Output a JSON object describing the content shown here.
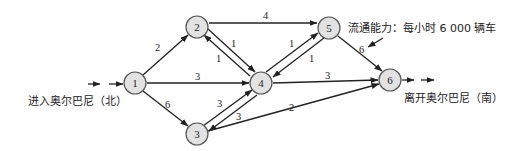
{
  "diagram": {
    "type": "directed-network-flow",
    "entry_label": "进入奥尔巴尼（北）",
    "exit_label": "离开奥尔巴尼（南）",
    "capacity_note": "流通能力：每小时 6 000 辆车",
    "nodes": [
      {
        "id": "1",
        "label": "1",
        "x": 135,
        "y": 83
      },
      {
        "id": "2",
        "label": "2",
        "x": 197,
        "y": 27
      },
      {
        "id": "3",
        "label": "3",
        "x": 197,
        "y": 134
      },
      {
        "id": "4",
        "label": "4",
        "x": 261,
        "y": 83
      },
      {
        "id": "5",
        "label": "5",
        "x": 329,
        "y": 28
      },
      {
        "id": "6",
        "label": "6",
        "x": 390,
        "y": 80
      }
    ],
    "edges": [
      {
        "from": "1",
        "to": "2",
        "capacity": "2"
      },
      {
        "from": "1",
        "to": "4",
        "capacity": "3"
      },
      {
        "from": "1",
        "to": "3",
        "capacity": "6"
      },
      {
        "from": "2",
        "to": "5",
        "capacity": "4"
      },
      {
        "from": "2",
        "to": "4",
        "capacity": "1"
      },
      {
        "from": "4",
        "to": "2",
        "capacity": "1"
      },
      {
        "from": "3",
        "to": "4",
        "capacity": "3"
      },
      {
        "from": "4",
        "to": "3",
        "capacity": "3"
      },
      {
        "from": "4",
        "to": "5",
        "capacity": "1"
      },
      {
        "from": "5",
        "to": "4",
        "capacity": "1"
      },
      {
        "from": "4",
        "to": "6",
        "capacity": "3"
      },
      {
        "from": "5",
        "to": "6",
        "capacity": "6"
      },
      {
        "from": "3",
        "to": "6",
        "capacity": "2"
      }
    ]
  }
}
